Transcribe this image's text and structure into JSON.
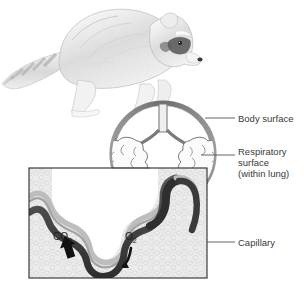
{
  "figure": {
    "background_color": "#ffffff",
    "ink_color": "#3a3a3a"
  },
  "organism": {
    "name": "raccoon",
    "description": "pencil-style drawing of a raccoon walking to the right, striped tail at left, masked face"
  },
  "cross_section": {
    "name": "lung-cross-section",
    "body_outline_color": "#6e6e6e",
    "lung_tissue_color": "#8e8e8e"
  },
  "labels": [
    {
      "id": "body-surface",
      "text": "Body surface"
    },
    {
      "id": "respiratory-surface",
      "lines": [
        "Respiratory",
        "surface",
        "(within lung)"
      ]
    },
    {
      "id": "capillary",
      "text": "Capillary"
    }
  ],
  "label_flat": {
    "body_surface": "Body surface",
    "respiratory_1": "Respiratory",
    "respiratory_2": "surface",
    "respiratory_3": "(within lung)",
    "capillary": "Capillary"
  },
  "inset": {
    "name": "alveolar-gas-exchange-detail",
    "tissue_color": "#e9e9e9",
    "capillary_color": "#4a4a4a",
    "gases": [
      {
        "id": "carbon-dioxide",
        "formula": "CO",
        "subscript": "2",
        "arrow": "outward-thick-black"
      },
      {
        "id": "oxygen",
        "formula": "O",
        "subscript": "2",
        "arrow": "inward-thin-curved"
      }
    ],
    "gas_flat": {
      "co2_main": "CO",
      "co2_sub": "2",
      "o2_main": "O",
      "o2_sub": "2"
    }
  }
}
